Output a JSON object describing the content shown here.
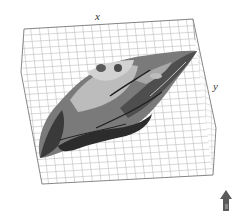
{
  "viewer": {
    "axes": {
      "x_label": "x",
      "y_label": "y"
    },
    "grid": {
      "visible": true,
      "line_color": "#b8b8b8",
      "frame_color": "#555555"
    },
    "surface": {
      "description": "3D terrain surface rendered in grayscale",
      "palette": [
        "#2e2e2e",
        "#4a4a4a",
        "#6b6b6b",
        "#8f8f8f",
        "#b5b5b5",
        "#d0d0d0"
      ]
    },
    "orientation_indicator": {
      "icon": "north-arrow",
      "color": "#555555"
    }
  }
}
